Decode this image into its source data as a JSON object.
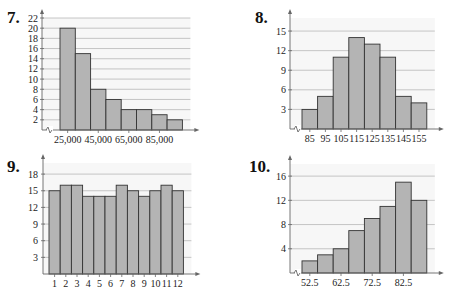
{
  "chart_data": [
    {
      "id": "7",
      "type": "bar",
      "title": "7.",
      "xlabel": "",
      "ylabel": "",
      "x_tick_labels": [
        "25,000",
        "45,000",
        "65,000",
        "85,000"
      ],
      "categories": [
        "25,000",
        "35,000",
        "45,000",
        "55,000",
        "65,000",
        "75,000",
        "85,000",
        "95,000"
      ],
      "values": [
        20,
        15,
        8,
        6,
        4,
        4,
        3,
        2
      ],
      "y_ticks": [
        2,
        4,
        6,
        8,
        10,
        12,
        14,
        16,
        18,
        20,
        22
      ],
      "ylim": [
        0,
        22
      ],
      "grid": true,
      "axis_break": true
    },
    {
      "id": "8",
      "type": "bar",
      "title": "8.",
      "xlabel": "",
      "ylabel": "",
      "categories": [
        "85",
        "95",
        "105",
        "115",
        "125",
        "135",
        "145",
        "155"
      ],
      "values": [
        3,
        5,
        11,
        14,
        13,
        11,
        5,
        4
      ],
      "y_ticks": [
        3,
        6,
        9,
        12,
        15
      ],
      "ylim": [
        0,
        17
      ],
      "grid": true,
      "axis_break": true
    },
    {
      "id": "9",
      "type": "bar",
      "title": "9.",
      "xlabel": "",
      "ylabel": "",
      "categories": [
        "1",
        "2",
        "3",
        "4",
        "5",
        "6",
        "7",
        "8",
        "9",
        "10",
        "11",
        "12"
      ],
      "values": [
        15,
        16,
        16,
        14,
        14,
        14,
        16,
        15,
        14,
        15,
        16,
        15
      ],
      "y_ticks": [
        3,
        6,
        9,
        12,
        15,
        18
      ],
      "ylim": [
        0,
        20
      ],
      "grid": true,
      "axis_break": false
    },
    {
      "id": "10",
      "type": "bar",
      "title": "10.",
      "xlabel": "",
      "ylabel": "",
      "x_tick_labels": [
        "52.5",
        "62.5",
        "72.5",
        "82.5"
      ],
      "categories": [
        "52.5",
        "57.5",
        "62.5",
        "67.5",
        "72.5",
        "77.5",
        "82.5",
        "87.5"
      ],
      "values": [
        2,
        3,
        4,
        7,
        9,
        11,
        15,
        12
      ],
      "y_ticks": [
        4,
        8,
        12,
        16
      ],
      "ylim": [
        0,
        18
      ],
      "grid": true,
      "axis_break": true
    }
  ],
  "style": {
    "bar_fill": "#b4b4b4",
    "bar_stroke": "#333333",
    "grid_color": "#b8b8b8",
    "plot_bg": "#f7f7f7",
    "axis_color": "#666666"
  }
}
